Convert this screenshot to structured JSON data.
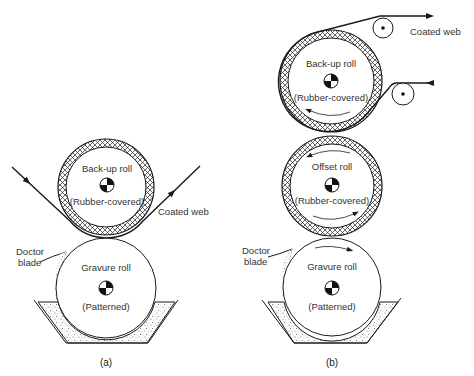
{
  "figure": {
    "panels": [
      {
        "id": "a",
        "caption": "(a)",
        "rolls": [
          {
            "name": "Back-up roll",
            "note": "(Rubber-covered)",
            "covering": "crosshatch"
          },
          {
            "name": "Gravure roll",
            "note": "(Patterned)",
            "covering": "none"
          }
        ],
        "labels": {
          "web": "Coated web",
          "doctor_line1": "Doctor",
          "doctor_line2": "blade"
        }
      },
      {
        "id": "b",
        "caption": "(b)",
        "rolls": [
          {
            "name": "Back-up roll",
            "note": "(Rubber-covered)",
            "covering": "crosshatch"
          },
          {
            "name": "Offset roll",
            "note": "(Rubber-covered)",
            "covering": "crosshatch"
          },
          {
            "name": "Gravure roll",
            "note": "(Patterned)",
            "covering": "none"
          }
        ],
        "labels": {
          "web": "Coated web",
          "doctor_line1": "Doctor",
          "doctor_line2": "blade"
        }
      }
    ],
    "colors": {
      "line": "#1a1a1a",
      "text": "#333333",
      "ink_pan": "#d9d9d9"
    }
  }
}
